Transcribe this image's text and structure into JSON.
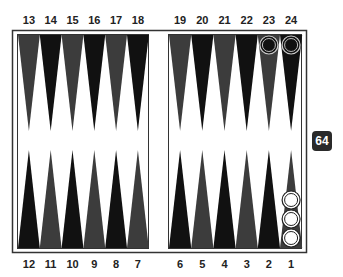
{
  "board": {
    "top_labels": [
      "13",
      "14",
      "15",
      "16",
      "17",
      "18",
      "19",
      "20",
      "21",
      "22",
      "23",
      "24"
    ],
    "bottom_labels": [
      "12",
      "11",
      "10",
      "9",
      "8",
      "7",
      "6",
      "5",
      "4",
      "3",
      "2",
      "1"
    ],
    "colors": {
      "dark_point": "#111111",
      "gray_point": "#3c3c3c",
      "frame": "#333333",
      "background": "#ffffff"
    },
    "checkers": [
      {
        "point": 23,
        "count": 1,
        "color": "black"
      },
      {
        "point": 24,
        "count": 1,
        "color": "black"
      },
      {
        "point": 1,
        "count": 3,
        "color": "white"
      }
    ]
  },
  "doubling_cube": {
    "value": "64"
  }
}
